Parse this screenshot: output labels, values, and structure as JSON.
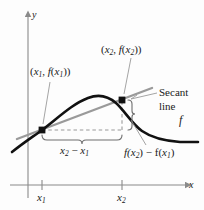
{
  "figure": {
    "background_color": "#fdfdfd"
  },
  "axes": {
    "x_label": "x",
    "y_label": "y",
    "axis_color": "#8a8a8a",
    "x_axis_y": 185,
    "y_axis_x": 28,
    "ticks": [
      {
        "label_main": "x",
        "label_sub": "1",
        "x": 42
      },
      {
        "label_main": "x",
        "label_sub": "2",
        "x": 122
      }
    ]
  },
  "curve": {
    "name": "f",
    "label": "f",
    "color": "#111111",
    "stroke_width": 2.6,
    "label_x": 180,
    "label_y": 120
  },
  "secant": {
    "label_line1": "Secant",
    "label_line2": "line",
    "color": "#9a9a9a",
    "stroke_width": 2.4,
    "label_x": 160,
    "label_y": 92
  },
  "points": [
    {
      "name": "point-1",
      "label_prefix": "(",
      "x_main": "x",
      "x_sub": "1",
      "comma": ", ",
      "f_main": "f",
      "fx_main": "x",
      "fx_sub": "1",
      "label_suffix": "))",
      "px": 42,
      "py": 130,
      "label_x": 30,
      "label_y": 68
    },
    {
      "name": "point-2",
      "label_prefix": "(",
      "x_main": "x",
      "x_sub": "2",
      "comma": ", ",
      "f_main": "f",
      "fx_main": "x",
      "fx_sub": "2",
      "label_suffix": "))",
      "px": 122,
      "py": 100,
      "label_x": 103,
      "label_y": 46
    }
  ],
  "annotations": {
    "run": {
      "x_main": "x",
      "x_sub": "2",
      "minus": " − ",
      "x2_main": "x",
      "x2_sub": "1",
      "label_x": 62,
      "label_y": 148
    },
    "rise": {
      "f1": "f(",
      "x1_main": "x",
      "x1_sub": "2",
      "mid": ") − f(",
      "x2_main": "x",
      "x2_sub": "1",
      "close": ")",
      "label_x": 125,
      "label_y": 150
    }
  },
  "colors": {
    "curve": "#111111",
    "secant": "#9a9a9a",
    "axis": "#8a8a8a",
    "dashed": "#9a9a9a",
    "brace": "#6e6e6e",
    "leader": "#9a9a9a",
    "text": "#1a1a1a"
  }
}
